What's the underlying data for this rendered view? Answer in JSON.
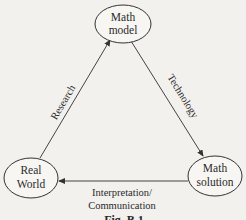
{
  "nodes": {
    "math_model": {
      "line1": "Math",
      "line2": "model"
    },
    "real_world": {
      "line1": "Real",
      "line2": "World"
    },
    "math_solution": {
      "line1": "Math",
      "line2": "solution"
    }
  },
  "edges": {
    "research": {
      "from": "Real World",
      "to": "Math model",
      "label": "Research"
    },
    "technology": {
      "from": "Math model",
      "to": "Math solution",
      "label": "Technology"
    },
    "interpretation": {
      "from": "Math solution",
      "to": "Real World",
      "line1": "Interpretation/",
      "line2": "Communication"
    }
  },
  "caption": "Fig. B.1",
  "colors": {
    "background": "#f2f1ee",
    "stroke": "#333333",
    "text": "#2a2a2a"
  }
}
